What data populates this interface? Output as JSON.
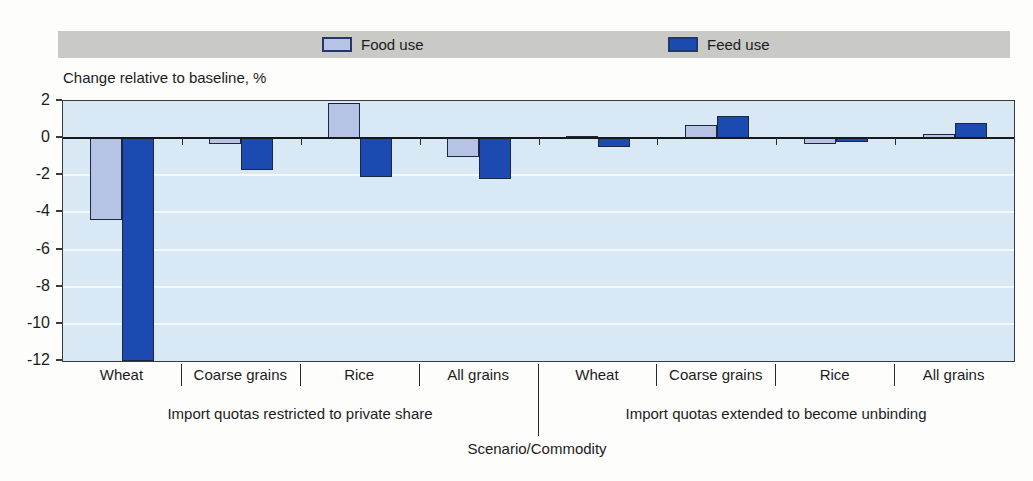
{
  "legend": {
    "band_color": "#c9c9c6",
    "items": [
      {
        "label": "Food use",
        "color": "#b7c3e4"
      },
      {
        "label": "Feed use",
        "color": "#1d4ab0"
      }
    ]
  },
  "y_axis_title": "Change relative to baseline, %",
  "chart_data": {
    "type": "bar",
    "title": "",
    "ylabel": "Change relative to baseline, %",
    "xlabel": "Scenario/Commodity",
    "ylim": [
      -12,
      2
    ],
    "y_ticks": [
      2,
      0,
      -2,
      -4,
      -6,
      -8,
      -10,
      -12
    ],
    "grid": "horizontal white lines every 2 units on light blue background",
    "legend_position": "top band",
    "categories": [
      "Wheat",
      "Coarse grains",
      "Rice",
      "All grains",
      "Wheat",
      "Coarse grains",
      "Rice",
      "All grains"
    ],
    "scenarios": [
      {
        "label": "Import quotas restricted to private share",
        "span": 4
      },
      {
        "label": "Import quotas extended to become unbinding",
        "span": 4
      }
    ],
    "series": [
      {
        "name": "Food use",
        "color": "#b7c3e4",
        "values": [
          -4.4,
          -0.3,
          1.9,
          -1.0,
          0.1,
          0.7,
          -0.3,
          0.2
        ]
      },
      {
        "name": "Feed use",
        "color": "#1d4ab0",
        "values": [
          -12,
          -1.7,
          -2.1,
          -2.2,
          -0.5,
          1.2,
          -0.2,
          0.8
        ]
      }
    ]
  },
  "x_axis_title": "Scenario/Commodity"
}
